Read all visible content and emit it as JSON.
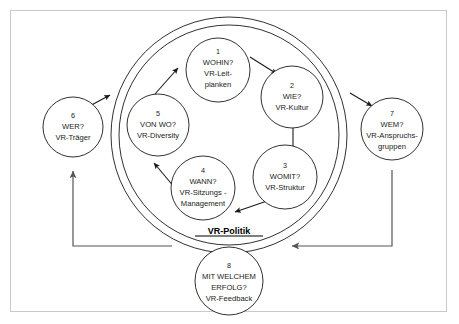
{
  "diagram": {
    "ring_label": "VR-Politik",
    "colors": {
      "stroke": "#1a1a1a",
      "frame": "#c9c9c9",
      "background": "#ffffff",
      "feedback": "#555555"
    },
    "nodes": [
      {
        "number": "1",
        "question": "WOHIN?",
        "answer_line1": "VR-Leit-",
        "answer_line2": "planken",
        "position": "inner-top"
      },
      {
        "number": "2",
        "question": "WIE?",
        "answer_line1": "VR-Kultur",
        "answer_line2": "",
        "position": "inner-upper-right"
      },
      {
        "number": "3",
        "question": "WOMIT?",
        "answer_line1": "VR-Struktur",
        "answer_line2": "",
        "position": "inner-lower-right"
      },
      {
        "number": "4",
        "question": "WANN?",
        "answer_line1": "VR-Sitzungs -",
        "answer_line2": "Management",
        "position": "inner-lower-left"
      },
      {
        "number": "5",
        "question": "VON WO?",
        "answer_line1": "VR-Diversity",
        "answer_line2": "",
        "position": "inner-upper-left"
      },
      {
        "number": "6",
        "question": "WER?",
        "answer_line1": "VR-Träger",
        "answer_line2": "",
        "position": "outer-left"
      },
      {
        "number": "7",
        "question": "WEM?",
        "answer_line1": "VR-Anspruchs-",
        "answer_line2": "gruppen",
        "position": "outer-right"
      },
      {
        "number": "8",
        "question": "MIT WELCHEM",
        "answer_line1": "ERFOLG?",
        "answer_line2": "VR-Feedback",
        "position": "outer-bottom"
      }
    ]
  }
}
